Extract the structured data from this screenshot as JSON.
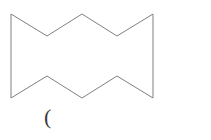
{
  "canvas": {
    "width": 211,
    "height": 140,
    "background_color": "#ffffff"
  },
  "figure": {
    "name": "zigzag-hexadecagon",
    "stroke_color": "#808080",
    "fill_color": "none",
    "stroke_width": 1,
    "vertex_count": 10,
    "points_attr": "11,14 47,36 82,14 117,36 153,14 153,98 117,76 82,98 47,76 11,98",
    "vertices": [
      {
        "label": "top-left-corner",
        "x": 11,
        "y": 14
      },
      {
        "label": "top-valley-left",
        "x": 47,
        "y": 36
      },
      {
        "label": "top-peak-center",
        "x": 82,
        "y": 14
      },
      {
        "label": "top-valley-right",
        "x": 117,
        "y": 36
      },
      {
        "label": "top-right-corner",
        "x": 153,
        "y": 14
      },
      {
        "label": "bottom-right-corner",
        "x": 153,
        "y": 98
      },
      {
        "label": "bottom-peak-right",
        "x": 117,
        "y": 76
      },
      {
        "label": "bottom-valley-center",
        "x": 82,
        "y": 98
      },
      {
        "label": "bottom-peak-left",
        "x": 47,
        "y": 76
      },
      {
        "label": "bottom-left-corner",
        "x": 11,
        "y": 98
      }
    ]
  },
  "caption": {
    "text": "(",
    "x": 44,
    "y": 106,
    "color": "#3a3a3a",
    "font_size": 22
  }
}
